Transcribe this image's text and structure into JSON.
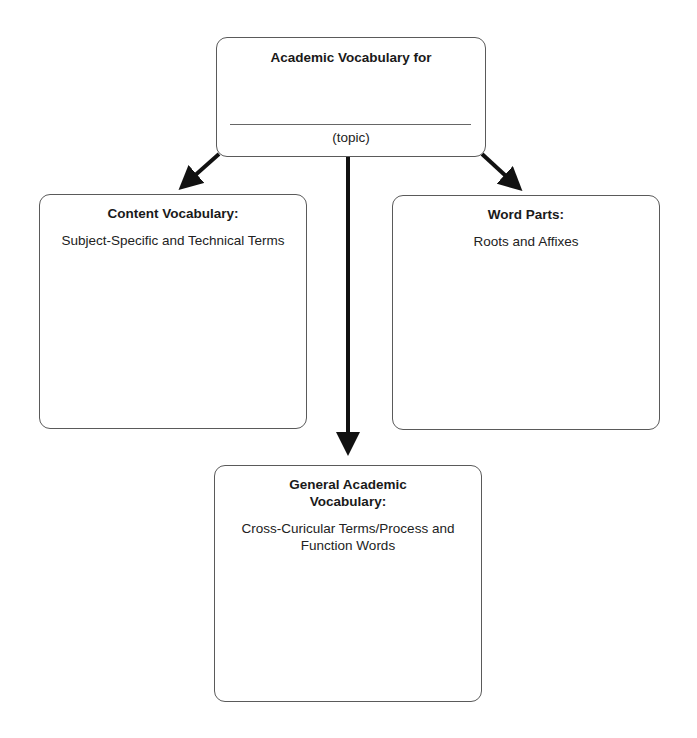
{
  "diagram": {
    "top": {
      "title": "Academic Vocabulary for",
      "blank_label": "(topic)"
    },
    "left": {
      "title": "Content Vocabulary:",
      "subtitle": "Subject-Specific and Technical Terms"
    },
    "right": {
      "title": "Word Parts:",
      "subtitle": "Roots and Affixes"
    },
    "bottom": {
      "title_line1": "General Academic",
      "title_line2": "Vocabulary:",
      "subtitle_line1": "Cross-Curicular Terms/Process and",
      "subtitle_line2": "Function Words"
    },
    "arrow_color": "#111111",
    "border_color": "#5a5a5a"
  }
}
